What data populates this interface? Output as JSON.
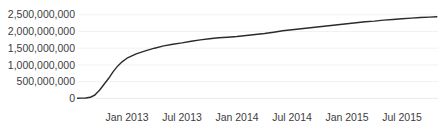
{
  "page": {
    "background_color": "#ffffff",
    "title": ""
  },
  "style": {
    "line_color": "#2b2b2b",
    "text_color": "#3d3d3d",
    "grid_color": "#f2f2f2",
    "baseline_grid_color": "#ececec"
  },
  "chart_data": {
    "type": "line",
    "title": "",
    "subtitle": "",
    "xlabel": "",
    "ylabel": "",
    "legend": {
      "visible": false
    },
    "grid": {
      "horizontal": true,
      "vertical": false
    },
    "ylim": [
      0,
      2500000000
    ],
    "y_tick_values": [
      0,
      500000000,
      1000000000,
      1500000000,
      2000000000,
      2500000000
    ],
    "y_tick_labels": [
      "0",
      "500,000,000",
      "1,000,000,000",
      "1,500,000,000",
      "2,000,000,000",
      "2,500,000,000"
    ],
    "x_tick_labels": [
      "Jan 2013",
      "Jul 2013",
      "Jan 2014",
      "Jul 2014",
      "Jan 2015",
      "Jul 2015"
    ],
    "x_tick_months_from_jan2013": [
      0,
      6,
      12,
      18,
      24,
      30
    ],
    "x_range_months_from_jan2013": [
      -5.4,
      33.8
    ],
    "series": [
      {
        "name": "cumulative-total",
        "color": "#2b2b2b",
        "points_month_value_billions": [
          [
            -5.4,
            0.0
          ],
          [
            -5.0,
            0.005
          ],
          [
            -4.5,
            0.01
          ],
          [
            -4.0,
            0.03
          ],
          [
            -3.5,
            0.1
          ],
          [
            -3.0,
            0.24
          ],
          [
            -2.5,
            0.42
          ],
          [
            -2.0,
            0.6
          ],
          [
            -1.5,
            0.8
          ],
          [
            -1.0,
            0.97
          ],
          [
            -0.5,
            1.1
          ],
          [
            0.0,
            1.2
          ],
          [
            1,
            1.33
          ],
          [
            2,
            1.42
          ],
          [
            3,
            1.5
          ],
          [
            4,
            1.57
          ],
          [
            5,
            1.62
          ],
          [
            6,
            1.66
          ],
          [
            7,
            1.71
          ],
          [
            8,
            1.75
          ],
          [
            9,
            1.78
          ],
          [
            10,
            1.81
          ],
          [
            11,
            1.83
          ],
          [
            12,
            1.85
          ],
          [
            13,
            1.88
          ],
          [
            14,
            1.91
          ],
          [
            15,
            1.94
          ],
          [
            16,
            1.98
          ],
          [
            17,
            2.02
          ],
          [
            18,
            2.05
          ],
          [
            19,
            2.08
          ],
          [
            20,
            2.11
          ],
          [
            21,
            2.14
          ],
          [
            22,
            2.17
          ],
          [
            23,
            2.2
          ],
          [
            24,
            2.23
          ],
          [
            25,
            2.26
          ],
          [
            26,
            2.29
          ],
          [
            27,
            2.31
          ],
          [
            28,
            2.34
          ],
          [
            29,
            2.36
          ],
          [
            30,
            2.38
          ],
          [
            31,
            2.4
          ],
          [
            32,
            2.42
          ],
          [
            33,
            2.43
          ],
          [
            33.8,
            2.44
          ]
        ]
      }
    ]
  }
}
